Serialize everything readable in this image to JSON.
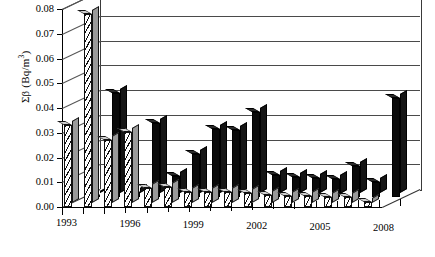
{
  "chart_data": {
    "type": "bar",
    "title": "",
    "subtitle": "",
    "xlabel": "",
    "ylabel": "Σβ (Bq/m³)",
    "ylabel_base": "Σβ (Bq/m",
    "ylabel_sup": "3",
    "ylabel_tail": ")",
    "ylim": [
      0.0,
      0.08
    ],
    "ytick_labels": [
      "0.00",
      "0.01",
      "0.02",
      "0.03",
      "0.04",
      "0.05",
      "0.06",
      "0.07",
      "0.08"
    ],
    "ytick_values": [
      0.0,
      0.01,
      0.02,
      0.03,
      0.04,
      0.05,
      0.06,
      0.07,
      0.08
    ],
    "grid": true,
    "legend": "none",
    "legend_position": "none",
    "projection": "3d-perspective",
    "categories": [
      "1993",
      "1994",
      "1995",
      "1996",
      "1997",
      "1998",
      "1999",
      "2000",
      "2001",
      "2002",
      "2003",
      "2004",
      "2005",
      "2006",
      "2007",
      "2008"
    ],
    "xtick_labels_shown": [
      "1993",
      "1996",
      "1999",
      "2002",
      "2005",
      "2008"
    ],
    "series": [
      {
        "name": "front-hatched",
        "style": "hatched",
        "values": [
          0.033,
          0.078,
          0.027,
          0.0305,
          0.0075,
          0.008,
          0.006,
          0.006,
          0.0062,
          0.0055,
          0.0048,
          0.0045,
          0.0045,
          0.0042,
          0.004,
          0.0022
        ]
      },
      {
        "name": "back-solid",
        "style": "solid-black",
        "values": [
          0.001,
          0.042,
          0.002,
          0.03,
          0.0085,
          0.0175,
          0.0275,
          0.027,
          0.0345,
          0.009,
          0.008,
          0.0078,
          0.0075,
          0.0125,
          0.006,
          0.04
        ]
      }
    ]
  }
}
